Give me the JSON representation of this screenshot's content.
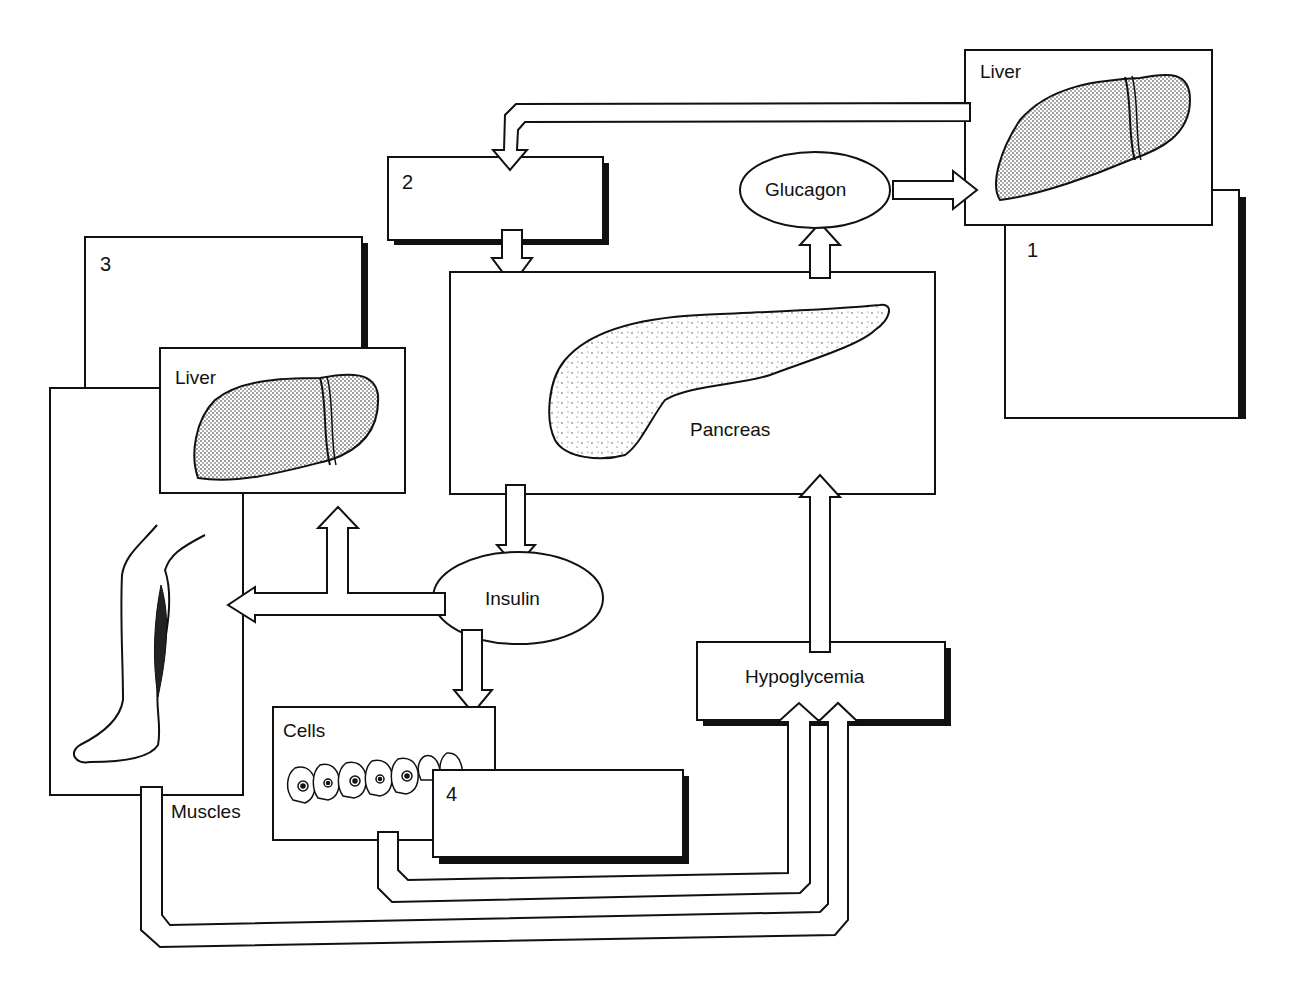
{
  "diagram": {
    "title": "",
    "boxes": {
      "liver_top": {
        "label": "Liver"
      },
      "box1": {
        "number": "1",
        "answer": ""
      },
      "box2": {
        "number": "2",
        "answer": ""
      },
      "box3": {
        "number": "3",
        "answer": ""
      },
      "box4": {
        "number": "4",
        "answer": ""
      },
      "pancreas": {
        "label": "Pancreas"
      },
      "liver_left": {
        "label": "Liver"
      },
      "muscles": {
        "label": "Muscles"
      },
      "cells": {
        "label": "Cells"
      },
      "hypoglycemia": {
        "label": "Hypoglycemia"
      }
    },
    "hormones": {
      "glucagon": {
        "label": "Glucagon"
      },
      "insulin": {
        "label": "Insulin"
      }
    },
    "arrows": [
      {
        "from": "liver_top",
        "to": "box2"
      },
      {
        "from": "box2",
        "to": "pancreas"
      },
      {
        "from": "pancreas",
        "to": "glucagon"
      },
      {
        "from": "glucagon",
        "to": "liver_top"
      },
      {
        "from": "pancreas",
        "to": "insulin"
      },
      {
        "from": "insulin",
        "to": "liver_left"
      },
      {
        "from": "insulin",
        "to": "muscles"
      },
      {
        "from": "insulin",
        "to": "cells"
      },
      {
        "from": "cells",
        "to": "hypoglycemia"
      },
      {
        "from": "muscles",
        "to": "hypoglycemia"
      },
      {
        "from": "hypoglycemia",
        "to": "pancreas"
      }
    ],
    "colors": {
      "stroke": "#111111",
      "fill": "#ffffff",
      "shadow": "#111111",
      "stipple": "#333333"
    }
  }
}
